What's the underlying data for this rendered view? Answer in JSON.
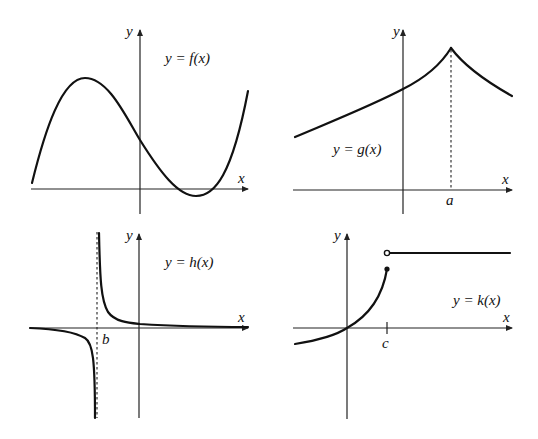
{
  "panels": [
    {
      "id": "f",
      "equation": "y = f(x)",
      "x_label": "x",
      "y_label": "y",
      "curve": "cubic: local max left of y-axis, positive y-intercept, local min right of y-axis dipping below x-axis"
    },
    {
      "id": "g",
      "equation": "y = g(x)",
      "x_label": "x",
      "y_label": "y",
      "point_label": "a",
      "curve": "increasing to a cusp at x = a, then decreasing; dashed line from cusp to x-axis"
    },
    {
      "id": "h",
      "equation": "y = h(x)",
      "x_label": "x",
      "y_label": "y",
      "point_label": "b",
      "curve": "vertical asymptote at x = b (dashed); horizontal asymptote y = 0"
    },
    {
      "id": "k",
      "equation": "y = k(x)",
      "x_label": "x",
      "y_label": "y",
      "point_label": "c",
      "curve": "increasing through origin to closed dot at x = c; jump to open circle then constant horizontal line"
    }
  ]
}
